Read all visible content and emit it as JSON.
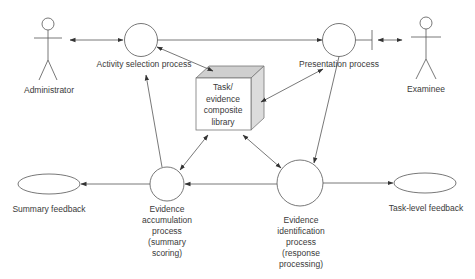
{
  "diagram": {
    "actors": [
      {
        "id": "administrator",
        "label": "Administrator"
      },
      {
        "id": "examinee",
        "label": "Examinee"
      }
    ],
    "processes": [
      {
        "id": "activity-selection",
        "label": "Activity selection process"
      },
      {
        "id": "presentation",
        "label": "Presentation process"
      },
      {
        "id": "evidence-accumulation",
        "label_lines": [
          "Evidence",
          "accumulation",
          "process",
          "(summary",
          "scoring)"
        ]
      },
      {
        "id": "evidence-identification",
        "label_lines": [
          "Evidence",
          "identification",
          "process",
          "(response",
          "processing)"
        ]
      }
    ],
    "library": {
      "label_lines": [
        "Task/",
        "evidence",
        "composite",
        "library"
      ]
    },
    "outputs": [
      {
        "id": "summary-feedback",
        "label": "Summary feedback"
      },
      {
        "id": "task-level-feedback",
        "label": "Task-level feedback"
      }
    ],
    "edges": [
      {
        "from": "administrator",
        "to": "activity-selection",
        "type": "bidirectional"
      },
      {
        "from": "activity-selection",
        "to": "presentation",
        "type": "directed"
      },
      {
        "from": "presentation",
        "to": "examinee",
        "type": "bidirectional"
      },
      {
        "from": "activity-selection",
        "to": "library",
        "type": "bidirectional"
      },
      {
        "from": "presentation",
        "to": "library",
        "type": "bidirectional"
      },
      {
        "from": "presentation",
        "to": "evidence-identification",
        "type": "directed"
      },
      {
        "from": "library",
        "to": "evidence-accumulation",
        "type": "bidirectional"
      },
      {
        "from": "library",
        "to": "evidence-identification",
        "type": "bidirectional"
      },
      {
        "from": "evidence-identification",
        "to": "evidence-accumulation",
        "type": "directed"
      },
      {
        "from": "evidence-identification",
        "to": "task-level-feedback",
        "type": "directed"
      },
      {
        "from": "evidence-accumulation",
        "to": "summary-feedback",
        "type": "directed"
      },
      {
        "from": "evidence-accumulation",
        "to": "activity-selection",
        "type": "directed"
      }
    ]
  }
}
